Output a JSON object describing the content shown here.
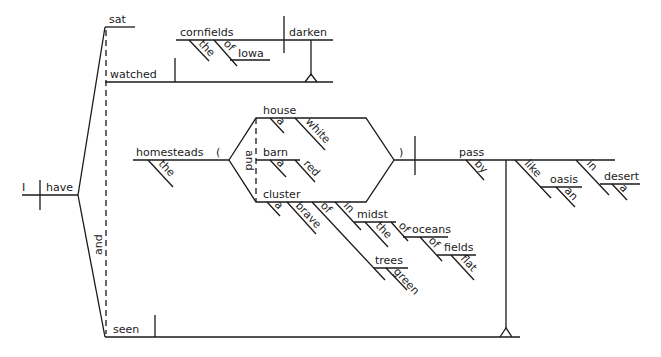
{
  "diagram": {
    "type": "sentence-diagram",
    "main_clause": {
      "subject": "I",
      "verb": "have",
      "conjunction": "and",
      "participles": [
        "sat",
        "watched",
        "seen"
      ]
    },
    "watched_clause": {
      "subject": "cornfields",
      "subject_modifiers": [
        "the",
        "of",
        "Iowa"
      ],
      "verb": "darken"
    },
    "seen_clause": {
      "subject": "homesteads",
      "subject_modifier": "the",
      "open_paren": "(",
      "close_paren": ")",
      "appositive_conjunction": "and",
      "appositives": [
        {
          "word": "house",
          "modifiers": [
            "a",
            "white"
          ]
        },
        {
          "word": "barn",
          "modifiers": [
            "a",
            "red"
          ]
        },
        {
          "word": "cluster",
          "modifiers": [
            "a",
            "brave"
          ]
        }
      ],
      "cluster_phrase": {
        "prep1": "of",
        "object1": "trees",
        "object1_modifier": "green",
        "prep2": "in",
        "object2": "midst",
        "object2_modifier": "the",
        "prep3": "of",
        "object3": "oceans",
        "prep4": "of",
        "object4": "fields",
        "object4_modifier": "flat"
      },
      "verb": "pass",
      "verb_modifier": "by",
      "like_phrase": {
        "prep": "like",
        "object": "oasis",
        "modifier": "an"
      },
      "in_phrase": {
        "prep": "in",
        "object": "desert",
        "modifier": "a"
      }
    }
  }
}
